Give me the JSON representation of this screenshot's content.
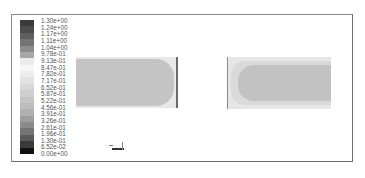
{
  "figure": {
    "type": "contour-plot",
    "colorbar": {
      "labels": [
        "1.30e+00",
        "1.24e+00",
        "1.17e+00",
        "1.11e+00",
        "1.04e+00",
        "9.78e-01",
        "9.13e-01",
        "8.47e-01",
        "7.82e-01",
        "7.17e-01",
        "6.52e-01",
        "5.87e-01",
        "5.22e-01",
        "4.56e-01",
        "3.91e-01",
        "3.26e-01",
        "2.61e-01",
        "1.96e-01",
        "1.30e-01",
        "6.52e-02",
        "0.00e+00"
      ],
      "colors": [
        "#3a3a3a",
        "#4c4c4c",
        "#5e5e5e",
        "#747474",
        "#8c8c8c",
        "#a8a8a8",
        "#ececec",
        "#f6f6f6",
        "#ededed",
        "#e2e2e2",
        "#d8d8d8",
        "#cfcfcf",
        "#c6c6c6",
        "#bdbdbd",
        "#b0b0b0",
        "#9e9e9e",
        "#8a8a8a",
        "#747474",
        "#5a5a5a",
        "#3a3a3a",
        "#111111"
      ],
      "min": 0.0,
      "max": 1.3
    },
    "panels": [
      {
        "name": "contour-left",
        "description": "rectangular domain, uniform mid value with lighter thin border, rounded right end"
      },
      {
        "name": "contour-right",
        "description": "rectangular domain, lighter outer band, darker core with rounded left end"
      }
    ],
    "axis_triad": {
      "visible": true
    }
  }
}
